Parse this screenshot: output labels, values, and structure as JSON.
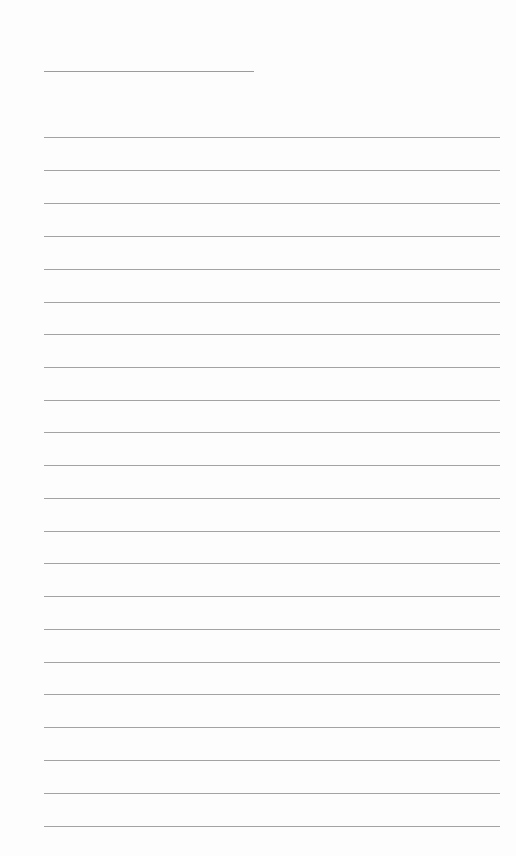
{
  "page": {
    "type": "blank-lined-paper",
    "background_color": "#fdfdfd",
    "line_color": "#a3a3a3",
    "header_line": {
      "x1": 44,
      "x2": 254,
      "y": 71
    },
    "ruled_lines": {
      "x1": 44,
      "x2": 500,
      "y_positions": [
        137,
        170,
        203,
        236,
        269,
        302,
        334,
        367,
        400,
        432,
        465,
        498,
        531,
        563,
        596,
        629,
        662,
        694,
        727,
        760,
        793,
        826
      ]
    }
  }
}
